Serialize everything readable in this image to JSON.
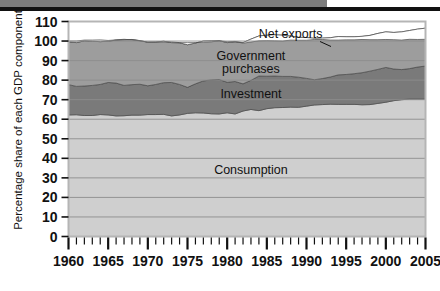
{
  "figure": {
    "name": "us-gdp-components-area-chart",
    "top_banner": {
      "gray_block": "",
      "black_rule": ""
    }
  },
  "chart_data": {
    "type": "area",
    "title": "",
    "xlabel": "",
    "ylabel": "Percentage share of each GDP component",
    "xlim": [
      1960,
      2005
    ],
    "ylim": [
      0,
      110
    ],
    "ytick_labels": [
      "0",
      "10",
      "20",
      "30",
      "40",
      "50",
      "60",
      "70",
      "80",
      "90",
      "100",
      "110"
    ],
    "yticks": [
      0,
      10,
      20,
      30,
      40,
      50,
      60,
      70,
      80,
      90,
      100,
      110
    ],
    "xtick_labels": [
      "1960",
      "1965",
      "1970",
      "1975",
      "1980",
      "1985",
      "1990",
      "1995",
      "2000",
      "2005"
    ],
    "xticks_major": [
      1960,
      1965,
      1970,
      1975,
      1980,
      1985,
      1990,
      1995,
      2000,
      2005
    ],
    "minor_tick_interval": 1,
    "grid": "horizontal",
    "legend": "inline-labels",
    "stacked": true,
    "annotations": [
      {
        "text": "Net exports",
        "x": 1988,
        "y": 103.5
      },
      {
        "text": "Government",
        "x": 1983,
        "y": 92.5
      },
      {
        "text": "purchases",
        "x": 1983,
        "y": 85.5
      },
      {
        "text": "Investment",
        "x": 1983,
        "y": 73.0
      },
      {
        "text": "Consumption",
        "x": 1983,
        "y": 34.0
      }
    ],
    "x": [
      1960,
      1961,
      1962,
      1963,
      1964,
      1965,
      1966,
      1967,
      1968,
      1969,
      1970,
      1971,
      1972,
      1973,
      1974,
      1975,
      1976,
      1977,
      1978,
      1979,
      1980,
      1981,
      1982,
      1983,
      1984,
      1985,
      1986,
      1987,
      1988,
      1989,
      1990,
      1991,
      1992,
      1993,
      1994,
      1995,
      1996,
      1997,
      1998,
      1999,
      2000,
      2001,
      2002,
      2003,
      2004,
      2005
    ],
    "series": [
      {
        "name": "Consumption",
        "color": "#cfcfcf",
        "values": [
          62.2,
          62.3,
          61.9,
          61.9,
          62.4,
          62.2,
          61.7,
          61.8,
          62.1,
          62.1,
          62.4,
          62.4,
          62.5,
          61.7,
          62.2,
          63.0,
          63.3,
          63.2,
          62.8,
          62.7,
          63.3,
          62.7,
          64.2,
          65.0,
          64.4,
          65.4,
          65.9,
          66.0,
          66.2,
          66.1,
          66.7,
          67.3,
          67.5,
          67.7,
          67.6,
          67.6,
          67.6,
          67.4,
          67.5,
          68.1,
          68.7,
          69.5,
          70.0,
          70.3,
          70.3,
          70.3
        ]
      },
      {
        "name": "Investment",
        "color": "#7a7a7a",
        "values": [
          15.5,
          14.5,
          15.1,
          15.4,
          15.4,
          16.6,
          16.8,
          15.5,
          15.6,
          15.8,
          14.7,
          15.4,
          16.2,
          17.1,
          15.6,
          13.3,
          14.8,
          16.4,
          17.3,
          17.6,
          15.6,
          16.6,
          13.9,
          14.9,
          17.7,
          16.6,
          16.2,
          15.9,
          15.7,
          15.4,
          14.2,
          12.9,
          13.3,
          13.9,
          15.1,
          15.3,
          15.7,
          16.4,
          17.1,
          17.4,
          17.8,
          16.2,
          15.4,
          15.6,
          16.4,
          16.9
        ]
      },
      {
        "name": "Government purchases",
        "color": "#9d9d9d",
        "values": [
          21.9,
          22.4,
          23.1,
          22.6,
          21.9,
          21.1,
          22.0,
          23.4,
          23.1,
          22.3,
          22.3,
          21.7,
          21.2,
          20.4,
          21.3,
          21.8,
          20.9,
          20.4,
          20.0,
          19.9,
          20.3,
          20.3,
          21.1,
          21.1,
          20.5,
          21.0,
          21.1,
          21.1,
          20.6,
          20.4,
          20.9,
          21.2,
          20.7,
          20.1,
          19.6,
          19.3,
          18.9,
          18.6,
          18.3,
          18.4,
          18.2,
          18.7,
          19.3,
          19.5,
          19.4,
          19.4
        ]
      },
      {
        "name": "Net exports",
        "color": "#ffffff",
        "values": [
          0.4,
          0.8,
          0.4,
          0.6,
          0.9,
          0.4,
          0.1,
          0.2,
          -0.2,
          -0.1,
          0.1,
          -0.1,
          -0.4,
          0.4,
          0.1,
          1.1,
          0.2,
          -0.6,
          -0.5,
          -0.1,
          0.5,
          0.2,
          -0.3,
          -1.5,
          -2.5,
          -2.8,
          -3.1,
          -3.0,
          -2.0,
          -1.5,
          -1.4,
          -0.6,
          -0.7,
          -1.2,
          -1.8,
          -1.6,
          -1.6,
          -1.6,
          -2.2,
          -3.2,
          -3.9,
          -3.7,
          -4.2,
          -4.5,
          -5.3,
          -5.7
        ]
      }
    ]
  }
}
